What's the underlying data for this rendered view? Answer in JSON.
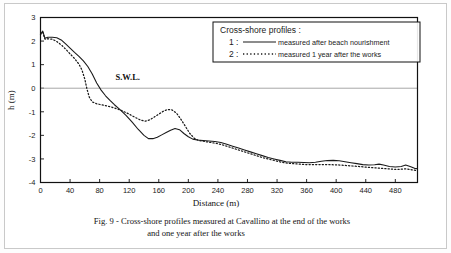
{
  "figure": {
    "caption_line1": "Fig. 9 - Cross-shore profiles measured at Cavallino at the end of the works",
    "caption_line2": "and one year after the works",
    "swl_label": "S.W.L."
  },
  "legend": {
    "title": "Cross-shore profiles :",
    "entries": [
      {
        "key": "1 :",
        "label": "measured after beach nourishment",
        "style": "solid"
      },
      {
        "key": "2 :",
        "label": "measured 1 year after the works",
        "style": "dotted"
      }
    ]
  },
  "chart_data": {
    "type": "line",
    "title": "",
    "xlabel": "Distance (m)",
    "ylabel": "h (m)",
    "xlim": [
      0,
      510
    ],
    "ylim": [
      -4,
      3
    ],
    "xticks": [
      0,
      40,
      80,
      120,
      160,
      200,
      240,
      280,
      320,
      360,
      400,
      440,
      480
    ],
    "yticks": [
      3,
      2,
      1,
      0,
      -1,
      -2,
      -3,
      -4
    ],
    "grid": false,
    "legend_position": "top-right",
    "annotations": [
      {
        "text": "S.W.L.",
        "x": 118,
        "y": 0.35
      }
    ],
    "reference_lines": [
      {
        "name": "still-water-level",
        "y": 0,
        "color": "#a8a8a8"
      }
    ],
    "series": [
      {
        "name": "measured after beach nourishment",
        "style": "solid",
        "color": "#1a1a1a",
        "points": [
          [
            0,
            2.3
          ],
          [
            3,
            2.42
          ],
          [
            6,
            2.12
          ],
          [
            10,
            2.16
          ],
          [
            16,
            2.16
          ],
          [
            22,
            2.14
          ],
          [
            28,
            2.05
          ],
          [
            34,
            1.88
          ],
          [
            40,
            1.7
          ],
          [
            46,
            1.52
          ],
          [
            52,
            1.35
          ],
          [
            58,
            1.16
          ],
          [
            64,
            0.92
          ],
          [
            70,
            0.6
          ],
          [
            76,
            0.22
          ],
          [
            82,
            -0.08
          ],
          [
            88,
            -0.32
          ],
          [
            94,
            -0.52
          ],
          [
            100,
            -0.7
          ],
          [
            108,
            -0.92
          ],
          [
            116,
            -1.16
          ],
          [
            124,
            -1.44
          ],
          [
            132,
            -1.74
          ],
          [
            140,
            -2.0
          ],
          [
            146,
            -2.14
          ],
          [
            152,
            -2.14
          ],
          [
            158,
            -2.08
          ],
          [
            164,
            -1.98
          ],
          [
            170,
            -1.88
          ],
          [
            176,
            -1.78
          ],
          [
            182,
            -1.71
          ],
          [
            188,
            -1.76
          ],
          [
            194,
            -1.92
          ],
          [
            200,
            -2.06
          ],
          [
            206,
            -2.16
          ],
          [
            212,
            -2.2
          ],
          [
            220,
            -2.22
          ],
          [
            228,
            -2.24
          ],
          [
            236,
            -2.26
          ],
          [
            244,
            -2.3
          ],
          [
            252,
            -2.38
          ],
          [
            260,
            -2.46
          ],
          [
            268,
            -2.54
          ],
          [
            276,
            -2.62
          ],
          [
            284,
            -2.7
          ],
          [
            292,
            -2.78
          ],
          [
            300,
            -2.86
          ],
          [
            308,
            -2.94
          ],
          [
            316,
            -3.0
          ],
          [
            324,
            -3.06
          ],
          [
            332,
            -3.12
          ],
          [
            340,
            -3.14
          ],
          [
            348,
            -3.14
          ],
          [
            356,
            -3.15
          ],
          [
            364,
            -3.16
          ],
          [
            372,
            -3.14
          ],
          [
            380,
            -3.1
          ],
          [
            388,
            -3.07
          ],
          [
            396,
            -3.06
          ],
          [
            404,
            -3.08
          ],
          [
            412,
            -3.12
          ],
          [
            420,
            -3.16
          ],
          [
            428,
            -3.2
          ],
          [
            436,
            -3.24
          ],
          [
            444,
            -3.26
          ],
          [
            452,
            -3.25
          ],
          [
            458,
            -3.22
          ],
          [
            464,
            -3.26
          ],
          [
            472,
            -3.32
          ],
          [
            480,
            -3.34
          ],
          [
            488,
            -3.32
          ],
          [
            494,
            -3.26
          ],
          [
            500,
            -3.32
          ],
          [
            506,
            -3.4
          ],
          [
            510,
            -3.42
          ]
        ]
      },
      {
        "name": "measured 1 year after the works",
        "style": "dotted",
        "color": "#1a1a1a",
        "points": [
          [
            0,
            2.28
          ],
          [
            3,
            2.38
          ],
          [
            6,
            2.08
          ],
          [
            10,
            2.1
          ],
          [
            16,
            2.08
          ],
          [
            22,
            1.98
          ],
          [
            28,
            1.84
          ],
          [
            34,
            1.66
          ],
          [
            40,
            1.46
          ],
          [
            46,
            1.26
          ],
          [
            52,
            1.02
          ],
          [
            56,
            0.78
          ],
          [
            60,
            0.38
          ],
          [
            63,
            -0.05
          ],
          [
            66,
            -0.38
          ],
          [
            70,
            -0.58
          ],
          [
            76,
            -0.66
          ],
          [
            82,
            -0.7
          ],
          [
            88,
            -0.74
          ],
          [
            96,
            -0.8
          ],
          [
            104,
            -0.88
          ],
          [
            112,
            -0.98
          ],
          [
            120,
            -1.1
          ],
          [
            128,
            -1.24
          ],
          [
            136,
            -1.36
          ],
          [
            142,
            -1.4
          ],
          [
            148,
            -1.34
          ],
          [
            154,
            -1.22
          ],
          [
            160,
            -1.1
          ],
          [
            166,
            -0.98
          ],
          [
            172,
            -0.9
          ],
          [
            178,
            -0.92
          ],
          [
            184,
            -1.06
          ],
          [
            190,
            -1.32
          ],
          [
            196,
            -1.62
          ],
          [
            202,
            -1.92
          ],
          [
            208,
            -2.12
          ],
          [
            214,
            -2.22
          ],
          [
            222,
            -2.26
          ],
          [
            230,
            -2.3
          ],
          [
            238,
            -2.34
          ],
          [
            246,
            -2.4
          ],
          [
            254,
            -2.48
          ],
          [
            262,
            -2.56
          ],
          [
            270,
            -2.64
          ],
          [
            278,
            -2.72
          ],
          [
            286,
            -2.8
          ],
          [
            294,
            -2.88
          ],
          [
            302,
            -2.96
          ],
          [
            310,
            -3.02
          ],
          [
            318,
            -3.08
          ],
          [
            326,
            -3.14
          ],
          [
            334,
            -3.18
          ],
          [
            342,
            -3.2
          ],
          [
            350,
            -3.22
          ],
          [
            358,
            -3.24
          ],
          [
            366,
            -3.24
          ],
          [
            374,
            -3.24
          ],
          [
            382,
            -3.24
          ],
          [
            390,
            -3.24
          ],
          [
            398,
            -3.25
          ],
          [
            406,
            -3.26
          ],
          [
            414,
            -3.28
          ],
          [
            422,
            -3.3
          ],
          [
            430,
            -3.32
          ],
          [
            438,
            -3.34
          ],
          [
            446,
            -3.36
          ],
          [
            454,
            -3.38
          ],
          [
            462,
            -3.4
          ],
          [
            470,
            -3.42
          ],
          [
            478,
            -3.44
          ],
          [
            486,
            -3.44
          ],
          [
            494,
            -3.42
          ],
          [
            502,
            -3.46
          ],
          [
            510,
            -3.5
          ]
        ]
      }
    ]
  }
}
